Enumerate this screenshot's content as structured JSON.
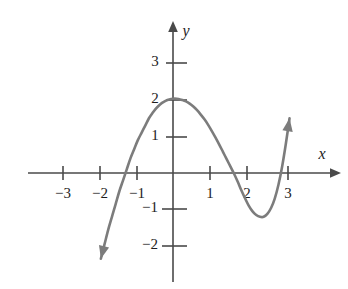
{
  "figure": {
    "background_color": "#ffffff",
    "curve_color": "#7c7c7c",
    "axis_color": "#4a4a4a",
    "label_color": "#1d1d1d"
  },
  "axes": {
    "x_label": "x",
    "y_label": "y",
    "x_ticks": [
      {
        "value": -3,
        "label": "−3"
      },
      {
        "value": -2,
        "label": "−2"
      },
      {
        "value": -1,
        "label": "−1"
      },
      {
        "value": 1,
        "label": "1"
      },
      {
        "value": 2,
        "label": "2"
      },
      {
        "value": 3,
        "label": "3"
      }
    ],
    "y_ticks": [
      {
        "value": 3,
        "label": "3"
      },
      {
        "value": 2,
        "label": "2"
      },
      {
        "value": 1,
        "label": "1"
      },
      {
        "value": -1,
        "label": "−1"
      },
      {
        "value": -2,
        "label": "−2"
      }
    ]
  },
  "chart_data": {
    "type": "line",
    "title": "",
    "xlabel": "x",
    "ylabel": "y",
    "xlim": [
      -3.6,
      3.6
    ],
    "ylim": [
      -2.6,
      3.4
    ],
    "grid": false,
    "legend": null,
    "series": [
      {
        "name": "polynomial curve",
        "x": [
          -1.95,
          -1.85,
          -1.75,
          -1.65,
          -1.55,
          -1.45,
          -1.35,
          -1.25,
          -1.15,
          -1.05,
          -0.95,
          -0.85,
          -0.75,
          -0.65,
          -0.55,
          -0.45,
          -0.35,
          -0.25,
          -0.15,
          -0.05,
          0.05,
          0.15,
          0.25,
          0.35,
          0.45,
          0.55,
          0.65,
          0.75,
          0.85,
          0.95,
          1.05,
          1.15,
          1.25,
          1.35,
          1.45,
          1.55,
          1.65,
          1.75,
          1.85,
          1.95,
          2.05,
          2.15,
          2.25,
          2.35,
          2.45,
          2.55,
          2.65,
          2.75,
          2.85,
          2.95,
          3.05,
          3.15
        ],
        "y": [
          -2.35,
          -1.95,
          -1.55,
          -1.2,
          -0.85,
          -0.5,
          -0.2,
          0.1,
          0.4,
          0.65,
          0.9,
          1.1,
          1.3,
          1.5,
          1.65,
          1.78,
          1.88,
          1.95,
          2.0,
          2.03,
          2.04,
          2.03,
          2.0,
          1.96,
          1.9,
          1.82,
          1.72,
          1.6,
          1.47,
          1.32,
          1.15,
          0.97,
          0.78,
          0.58,
          0.38,
          0.18,
          -0.02,
          -0.24,
          -0.48,
          -0.7,
          -0.9,
          -1.05,
          -1.15,
          -1.2,
          -1.2,
          -1.12,
          -0.96,
          -0.7,
          -0.32,
          0.18,
          0.8,
          1.5
        ],
        "markers": false
      }
    ],
    "annotations": {
      "y_intercept": 2,
      "local_maximum": {
        "x": 0.05,
        "y": 2.05
      },
      "local_minimum": {
        "x": 2.4,
        "y": -1.2
      },
      "x_intercepts": [
        -1.45,
        1.63,
        2.87
      ],
      "left_end_arrow": "down-left",
      "right_end_arrow": "up-right"
    }
  }
}
